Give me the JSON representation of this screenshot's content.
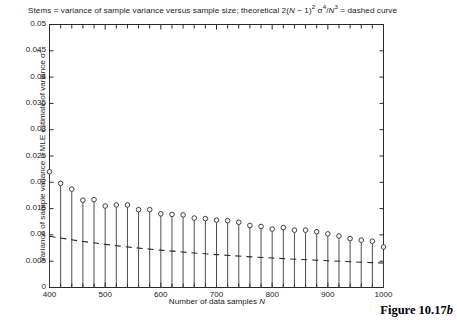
{
  "chart_data": {
    "type": "line",
    "title_parts": {
      "lead": "Stems = variance of sample variance versus sample size; theoretical 2(",
      "n1": "N",
      "mid1": " − 1)",
      "sup1": "2",
      "mid2": " σ",
      "sup2": "4",
      "mid3": "/",
      "n2": "N",
      "sup3": "3",
      "tail": " = dashed curve"
    },
    "xlabel": "Number of data samples N",
    "xlabel_parts": {
      "text": "Number of data samples ",
      "symbol": "N"
    },
    "ylabel": "Variance of sample variance = MLE estimate of variance σ²",
    "ylabel_parts": {
      "text": "Variance of sample variance = MLE estimate of variance σ",
      "sup": "2"
    },
    "caption": "Figure 10.17b",
    "caption_parts": {
      "text": "Figure 10.17",
      "italic": "b"
    },
    "xlim": [
      400,
      1000
    ],
    "ylim": [
      0,
      0.05
    ],
    "xticks": [
      400,
      500,
      600,
      700,
      800,
      900,
      1000
    ],
    "xtick_labels": [
      "400",
      "500",
      "600",
      "700",
      "800",
      "900",
      "1000"
    ],
    "xminor_step": 20,
    "yticks": [
      0,
      0.005,
      0.01,
      0.015,
      0.02,
      0.025,
      0.03,
      0.035,
      0.04,
      0.045,
      0.05
    ],
    "ytick_labels": [
      "0",
      "0.005",
      "0.01",
      "0.015",
      "0.02",
      "0.025",
      "0.03",
      "0.035",
      "0.04",
      "0.045",
      "0.05"
    ],
    "grid": false,
    "legend": null,
    "box": true,
    "series": [
      {
        "name": "Stems = variance of sample variance (empirical)",
        "style": "stem",
        "marker": "open-circle",
        "color": "#3a3a3a",
        "x": [
          400,
          420,
          440,
          460,
          480,
          500,
          520,
          540,
          560,
          580,
          600,
          620,
          640,
          660,
          680,
          700,
          720,
          740,
          760,
          780,
          800,
          820,
          840,
          860,
          880,
          900,
          920,
          940,
          960,
          980,
          1000
        ],
        "values": [
          0.022,
          0.0198,
          0.0187,
          0.0166,
          0.0167,
          0.0155,
          0.0157,
          0.0157,
          0.0148,
          0.0148,
          0.014,
          0.0139,
          0.0138,
          0.0132,
          0.0131,
          0.0128,
          0.0127,
          0.0124,
          0.0118,
          0.0116,
          0.0111,
          0.0114,
          0.0109,
          0.0109,
          0.0106,
          0.0102,
          0.0098,
          0.0093,
          0.009,
          0.0088,
          0.0077
        ]
      },
      {
        "name": "theoretical 2(N-1)^2 sigma^4/N^3 (dashed curve)",
        "style": "dashed",
        "color": "#2a2a2a",
        "x": [
          400,
          450,
          500,
          550,
          600,
          650,
          700,
          750,
          800,
          850,
          900,
          950,
          1000
        ],
        "values": [
          0.00975,
          0.0089,
          0.0082,
          0.0076,
          0.0071,
          0.00665,
          0.00625,
          0.0059,
          0.0056,
          0.00533,
          0.00508,
          0.00485,
          0.00465
        ]
      }
    ]
  },
  "colors": {
    "axis": "#2a2a2a",
    "stem": "#3a3a3a",
    "marker_stroke": "#2b2b2b",
    "text": "#1b1b1b",
    "background": "#ffffff"
  }
}
